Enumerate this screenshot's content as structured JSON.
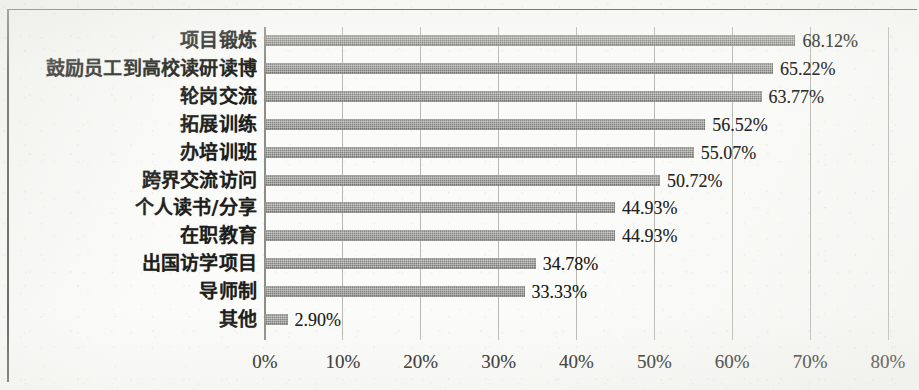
{
  "chart_data": {
    "type": "bar",
    "orientation": "horizontal",
    "title": "",
    "subtitle": "",
    "xlabel": "",
    "ylabel": "",
    "xlim": [
      0,
      80
    ],
    "grid": true,
    "legend": null,
    "value_format": "percent",
    "categories": [
      "项目锻炼",
      "鼓励员工到高校读研读博",
      "轮岗交流",
      "拓展训练",
      "办培训班",
      "跨界交流访问",
      "个人读书/分享",
      "在职教育",
      "出国访学项目",
      "导师制",
      "其他"
    ],
    "values": [
      68.12,
      65.22,
      63.77,
      56.52,
      55.07,
      50.72,
      44.93,
      44.93,
      34.78,
      33.33,
      2.9
    ],
    "data_labels": [
      "68.12%",
      "65.22%",
      "63.77%",
      "56.52%",
      "55.07%",
      "50.72%",
      "44.93%",
      "44.93%",
      "34.78%",
      "33.33%",
      "2.90%"
    ],
    "x_ticks": [
      0,
      10,
      20,
      30,
      40,
      50,
      60,
      70,
      80
    ],
    "x_tick_labels": [
      "0%",
      "10%",
      "20%",
      "30%",
      "40%",
      "50%",
      "60%",
      "70%",
      "80%"
    ],
    "colors": {
      "bar": "#7b7b78",
      "gridline": "#b9b9b4",
      "axis": "#8e8e88",
      "frame": "#4a4a48",
      "text": "#1b1b19",
      "background": "#fbfbf9"
    }
  }
}
